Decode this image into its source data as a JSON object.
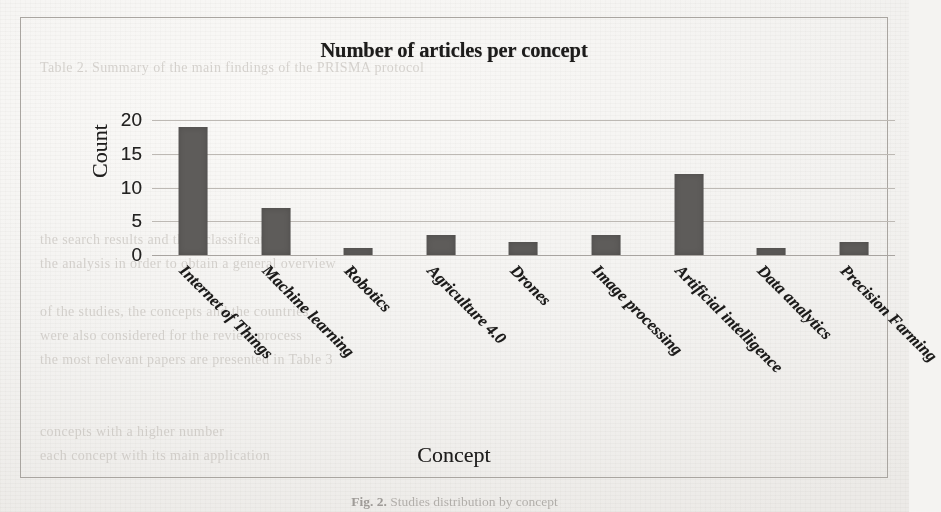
{
  "page": {
    "background_color": "#f4f3f1",
    "frame_border_color": "#a9a5a0",
    "caption_prefix": "Fig. 2.",
    "caption_text": "Studies distribution by concept"
  },
  "chart_data": {
    "type": "bar",
    "title": "Number of articles per concept",
    "xlabel": "Concept",
    "ylabel": "Count",
    "ylim": [
      0,
      20
    ],
    "yticks": [
      0,
      5,
      10,
      15,
      20
    ],
    "grid": true,
    "legend": false,
    "bar_color": "#5e5c5a",
    "categories": [
      "Internet of Things",
      "Machine learning",
      "Robotics",
      "Agriculture 4.0",
      "Drones",
      "Image processing",
      "Artificial intelligence",
      "Data analytics",
      "Precision Farming"
    ],
    "values": [
      19,
      7,
      1,
      3,
      2,
      3,
      12,
      1,
      2
    ]
  },
  "ghost_text": [
    "Table 2. Summary of the main findings of the PRISMA protocol",
    "the search results and their classification",
    "the analysis in order to obtain a general overview",
    "of the studies, the concepts and the countries",
    "were also considered for the review process",
    "the most relevant papers are presented in Table 3",
    "concepts with a higher number",
    "each concept with its main application"
  ]
}
